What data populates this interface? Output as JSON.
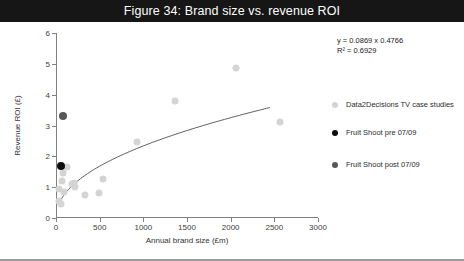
{
  "figure": {
    "title": "Figure 34: Brand size vs. revenue ROI"
  },
  "annotation": {
    "equation": "y = 0.0869 x 0.4766",
    "r_squared": "R² = 0.6929"
  },
  "legend": {
    "items": [
      {
        "label": "Data2Decisions TV case studies",
        "color": "#d4d4d4"
      },
      {
        "label": "Fruit Shoot pre 07/09",
        "color": "#0d0d0d"
      },
      {
        "label": "Fruit Shoot post 07/09",
        "color": "#575757"
      }
    ]
  },
  "chart_data": {
    "type": "scatter",
    "title": "Figure 34: Brand size vs. revenue ROI",
    "xlabel": "Annual brand size (£m)",
    "ylabel": "Revenue ROI (£)",
    "xlim": [
      0,
      3000
    ],
    "ylim": [
      0,
      6
    ],
    "xticks": [
      0,
      500,
      1000,
      1500,
      2000,
      2500,
      3000
    ],
    "yticks": [
      0,
      1,
      2,
      3,
      4,
      5,
      6
    ],
    "grid": false,
    "legend_position": "right",
    "series": [
      {
        "name": "Data2Decisions TV case studies",
        "color": "#d4d4d4",
        "points": [
          {
            "x": 30,
            "y": 0.55
          },
          {
            "x": 40,
            "y": 0.95
          },
          {
            "x": 55,
            "y": 0.45
          },
          {
            "x": 70,
            "y": 1.2
          },
          {
            "x": 80,
            "y": 1.45
          },
          {
            "x": 95,
            "y": 0.85
          },
          {
            "x": 130,
            "y": 1.65
          },
          {
            "x": 185,
            "y": 1.1
          },
          {
            "x": 205,
            "y": 1.15
          },
          {
            "x": 215,
            "y": 1.0
          },
          {
            "x": 330,
            "y": 0.75
          },
          {
            "x": 490,
            "y": 0.8
          },
          {
            "x": 540,
            "y": 1.25
          },
          {
            "x": 930,
            "y": 2.45
          },
          {
            "x": 1360,
            "y": 3.8
          },
          {
            "x": 2060,
            "y": 4.85
          },
          {
            "x": 2560,
            "y": 3.1
          }
        ]
      },
      {
        "name": "Fruit Shoot pre 07/09",
        "color": "#0d0d0d",
        "points": [
          {
            "x": 55,
            "y": 1.7
          }
        ]
      },
      {
        "name": "Fruit Shoot post 07/09",
        "color": "#575757",
        "points": [
          {
            "x": 75,
            "y": 3.3
          }
        ]
      }
    ],
    "trendline": {
      "type": "power",
      "equation": "y = 0.0869 x 0.4766",
      "r_squared": 0.6929,
      "coefficient": 0.0869,
      "exponent": 0.4766,
      "color": "#4a4a4a"
    }
  }
}
